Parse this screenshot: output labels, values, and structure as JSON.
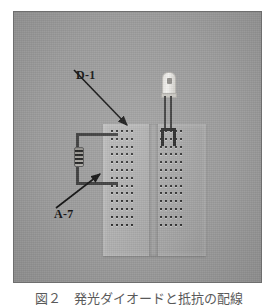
{
  "figure": {
    "background_color": "#9d9d9d",
    "border_color": "#6e6e6e",
    "caption": "図２　発光ダイオードと抵抗の配線"
  },
  "labels": {
    "led": "D-1",
    "resistor_row": "A-7"
  },
  "components": {
    "led": {
      "name": "light-emitting-diode",
      "body_color": "#f3f2ef",
      "lead_color": "#3a3a3a"
    },
    "resistor": {
      "name": "resistor",
      "body_color": "#b0aea9",
      "band_color": "#202020",
      "band_count": 4
    },
    "breadboard": {
      "name": "solderless-breadboard",
      "surface_color": "#a6a6a6",
      "hole_color": "#2f2f2f",
      "rows": 13,
      "columns_per_side": 5,
      "sides": 2
    }
  },
  "arrows": [
    {
      "name": "arrow-to-led-lead",
      "from_label": "D-1",
      "to": "led-anode-lead"
    },
    {
      "name": "arrow-to-row-a7",
      "from_label": "A-7",
      "to": "breadboard-row-a7"
    }
  ]
}
